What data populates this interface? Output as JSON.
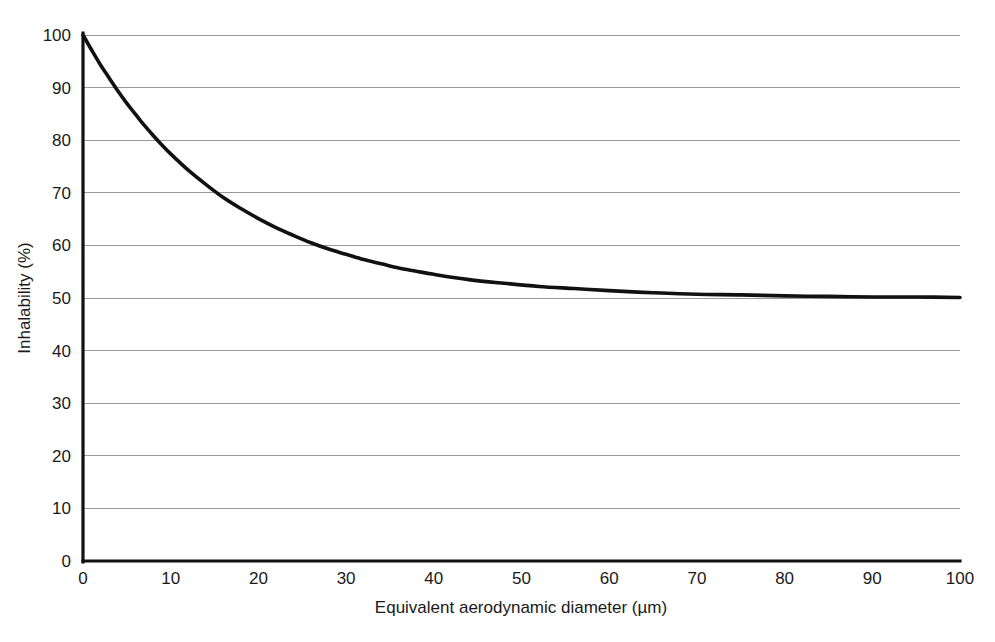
{
  "figure": {
    "background_color": "#ffffff",
    "width": 995,
    "height": 642
  },
  "chart_data": {
    "type": "line",
    "title": "",
    "subtitle": "",
    "xlabel": "Equivalent aerodynamic diameter (µm)",
    "ylabel": "Inhalability (%)",
    "xlim": [
      0,
      100
    ],
    "ylim": [
      0,
      100
    ],
    "xticks": [
      0,
      10,
      20,
      30,
      40,
      50,
      60,
      70,
      80,
      90,
      100
    ],
    "yticks": [
      0,
      10,
      20,
      30,
      40,
      50,
      60,
      70,
      80,
      90,
      100
    ],
    "xtick_labels": [
      "0",
      "10",
      "20",
      "30",
      "40",
      "50",
      "60",
      "70",
      "80",
      "90",
      "100"
    ],
    "ytick_labels": [
      "0",
      "10",
      "20",
      "30",
      "40",
      "50",
      "60",
      "70",
      "80",
      "90",
      "100"
    ],
    "grid": {
      "horizontal": true,
      "vertical": false,
      "color": "#9a9a9a"
    },
    "legend": {
      "visible": false,
      "position": "none",
      "entries": []
    },
    "annotations": [],
    "series": [
      {
        "name": "Inhalable fraction",
        "color": "#111111",
        "line_width": 3.6,
        "equation": "IF = 50 * (1 + exp(-0.06 * d))",
        "x": [
          0,
          1,
          2,
          3,
          4,
          5,
          6,
          7,
          8,
          9,
          10,
          12,
          14,
          16,
          18,
          20,
          22,
          24,
          26,
          28,
          30,
          32,
          34,
          36,
          38,
          40,
          44,
          48,
          52,
          56,
          60,
          65,
          70,
          75,
          80,
          85,
          90,
          95,
          100
        ],
        "values": [
          100.0,
          97.1,
          94.3,
          91.8,
          89.3,
          87.0,
          84.9,
          82.8,
          80.9,
          79.1,
          77.4,
          74.3,
          71.6,
          69.1,
          67.0,
          65.1,
          63.4,
          61.9,
          60.5,
          59.3,
          58.3,
          57.3,
          56.5,
          55.7,
          55.1,
          54.5,
          53.5,
          52.8,
          52.2,
          51.8,
          51.4,
          51.0,
          50.7,
          50.6,
          50.4,
          50.3,
          50.2,
          50.2,
          50.1
        ]
      }
    ],
    "baseline": {
      "name": "x-axis baseline",
      "y": 0
    }
  }
}
